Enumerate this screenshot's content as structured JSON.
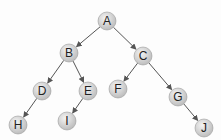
{
  "diagram": {
    "type": "binary-tree",
    "nodes": [
      {
        "id": "A",
        "label": "A",
        "x": 107,
        "y": 21
      },
      {
        "id": "B",
        "label": "B",
        "x": 69,
        "y": 53
      },
      {
        "id": "C",
        "label": "C",
        "x": 143,
        "y": 56
      },
      {
        "id": "D",
        "label": "D",
        "x": 42,
        "y": 91
      },
      {
        "id": "E",
        "label": "E",
        "x": 88,
        "y": 91
      },
      {
        "id": "F",
        "label": "F",
        "x": 118,
        "y": 89
      },
      {
        "id": "G",
        "label": "G",
        "x": 178,
        "y": 97
      },
      {
        "id": "H",
        "label": "H",
        "x": 18,
        "y": 125
      },
      {
        "id": "I",
        "label": "I",
        "x": 67,
        "y": 121
      },
      {
        "id": "J",
        "label": "J",
        "x": 204,
        "y": 128
      }
    ],
    "edges": [
      [
        "A",
        "B"
      ],
      [
        "A",
        "C"
      ],
      [
        "B",
        "D"
      ],
      [
        "B",
        "E"
      ],
      [
        "C",
        "F"
      ],
      [
        "C",
        "G"
      ],
      [
        "D",
        "H"
      ],
      [
        "E",
        "I"
      ],
      [
        "G",
        "J"
      ]
    ],
    "colors": {
      "node_fill": "#d0d0d0",
      "node_stroke": "#9a9a9a",
      "edge": "#555555"
    }
  }
}
